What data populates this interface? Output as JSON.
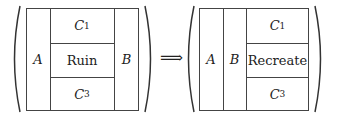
{
  "diagram": {
    "left": {
      "col_a": "A",
      "col_b": "B",
      "top": {
        "base": "C",
        "sub": "1"
      },
      "middle": "Ruin",
      "bottom": {
        "base": "C",
        "sub": "3"
      }
    },
    "arrow": "⟹",
    "right": {
      "col_a": "A",
      "col_b": "B",
      "top": {
        "base": "C",
        "sub": "1"
      },
      "middle": "Recreate",
      "bottom": {
        "base": "C",
        "sub": "3"
      }
    }
  }
}
